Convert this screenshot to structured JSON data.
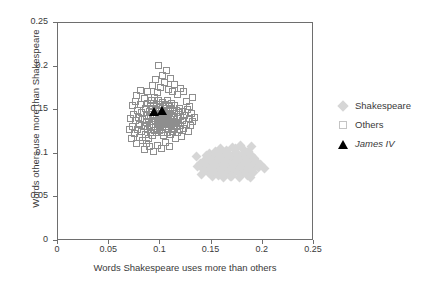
{
  "chart_data": {
    "type": "scatter",
    "title": "",
    "xlabel": "Words Shakespeare uses more than others",
    "ylabel": "Words others use more than Shakespeare",
    "xlim": [
      0,
      0.25
    ],
    "ylim": [
      0,
      0.25
    ],
    "xticks": [
      "0",
      "0.05",
      "0.1",
      "0.15",
      "0.2",
      "0.25"
    ],
    "xtick_values": [
      0,
      0.05,
      0.1,
      0.15,
      0.2,
      0.25
    ],
    "yticks": [
      "0",
      "0.05",
      "0.1",
      "0.15",
      "0.2",
      "0.25"
    ],
    "ytick_values": [
      0,
      0.05,
      0.1,
      0.15,
      0.2,
      0.25
    ],
    "grid": false,
    "legend_position": "right",
    "colors": {
      "shakespeare": "#d6d6d6",
      "others": "#8e8e8e",
      "james_iv": "#000000",
      "axis": "#6e6e6e",
      "text": "#3a3a3a",
      "background": "#ffffff"
    },
    "series": [
      {
        "name": "Shakespeare",
        "marker": "diamond",
        "fill": "#d6d6d6",
        "points": [
          [
            0.135,
            0.097
          ],
          [
            0.139,
            0.089
          ],
          [
            0.142,
            0.082
          ],
          [
            0.144,
            0.094
          ],
          [
            0.146,
            0.086
          ],
          [
            0.147,
            0.078
          ],
          [
            0.148,
            0.1
          ],
          [
            0.149,
            0.091
          ],
          [
            0.15,
            0.084
          ],
          [
            0.151,
            0.074
          ],
          [
            0.152,
            0.095
          ],
          [
            0.153,
            0.088
          ],
          [
            0.154,
            0.081
          ],
          [
            0.155,
            0.102
          ],
          [
            0.156,
            0.093
          ],
          [
            0.157,
            0.086
          ],
          [
            0.158,
            0.079
          ],
          [
            0.159,
            0.097
          ],
          [
            0.16,
            0.09
          ],
          [
            0.16,
            0.083
          ],
          [
            0.161,
            0.076
          ],
          [
            0.162,
            0.099
          ],
          [
            0.163,
            0.092
          ],
          [
            0.163,
            0.085
          ],
          [
            0.164,
            0.078
          ],
          [
            0.165,
            0.104
          ],
          [
            0.165,
            0.095
          ],
          [
            0.166,
            0.088
          ],
          [
            0.167,
            0.081
          ],
          [
            0.168,
            0.074
          ],
          [
            0.168,
            0.098
          ],
          [
            0.169,
            0.091
          ],
          [
            0.17,
            0.084
          ],
          [
            0.17,
            0.107
          ],
          [
            0.171,
            0.077
          ],
          [
            0.172,
            0.094
          ],
          [
            0.172,
            0.087
          ],
          [
            0.173,
            0.08
          ],
          [
            0.174,
            0.101
          ],
          [
            0.174,
            0.092
          ],
          [
            0.175,
            0.085
          ],
          [
            0.176,
            0.078
          ],
          [
            0.176,
            0.097
          ],
          [
            0.177,
            0.09
          ],
          [
            0.178,
            0.083
          ],
          [
            0.178,
            0.11
          ],
          [
            0.179,
            0.076
          ],
          [
            0.18,
            0.094
          ],
          [
            0.18,
            0.087
          ],
          [
            0.181,
            0.1
          ],
          [
            0.182,
            0.081
          ],
          [
            0.182,
            0.092
          ],
          [
            0.183,
            0.085
          ],
          [
            0.184,
            0.097
          ],
          [
            0.184,
            0.078
          ],
          [
            0.185,
            0.089
          ],
          [
            0.186,
            0.103
          ],
          [
            0.186,
            0.082
          ],
          [
            0.187,
            0.094
          ],
          [
            0.188,
            0.087
          ],
          [
            0.188,
            0.073
          ],
          [
            0.189,
            0.098
          ],
          [
            0.19,
            0.09
          ],
          [
            0.191,
            0.083
          ],
          [
            0.192,
            0.095
          ],
          [
            0.193,
            0.087
          ],
          [
            0.194,
            0.091
          ],
          [
            0.196,
            0.084
          ],
          [
            0.198,
            0.088
          ],
          [
            0.202,
            0.083
          ],
          [
            0.14,
            0.076
          ],
          [
            0.143,
            0.089
          ],
          [
            0.145,
            0.098
          ],
          [
            0.151,
            0.08
          ],
          [
            0.154,
            0.103
          ],
          [
            0.157,
            0.075
          ],
          [
            0.159,
            0.106
          ],
          [
            0.162,
            0.073
          ],
          [
            0.166,
            0.1
          ],
          [
            0.169,
            0.074
          ],
          [
            0.173,
            0.106
          ],
          [
            0.177,
            0.073
          ],
          [
            0.181,
            0.105
          ],
          [
            0.185,
            0.075
          ],
          [
            0.189,
            0.108
          ],
          [
            0.191,
            0.078
          ],
          [
            0.136,
            0.086
          ],
          [
            0.148,
            0.093
          ],
          [
            0.152,
            0.089
          ],
          [
            0.158,
            0.096
          ],
          [
            0.164,
            0.09
          ],
          [
            0.171,
            0.089
          ],
          [
            0.175,
            0.093
          ],
          [
            0.179,
            0.086
          ],
          [
            0.183,
            0.09
          ],
          [
            0.187,
            0.085
          ]
        ]
      },
      {
        "name": "Others",
        "marker": "open-square",
        "stroke": "#8e8e8e",
        "points": [
          [
            0.072,
            0.117
          ],
          [
            0.073,
            0.131
          ],
          [
            0.074,
            0.145
          ],
          [
            0.075,
            0.123
          ],
          [
            0.076,
            0.138
          ],
          [
            0.076,
            0.16
          ],
          [
            0.077,
            0.112
          ],
          [
            0.078,
            0.128
          ],
          [
            0.078,
            0.15
          ],
          [
            0.079,
            0.142
          ],
          [
            0.08,
            0.119
          ],
          [
            0.08,
            0.134
          ],
          [
            0.081,
            0.157
          ],
          [
            0.082,
            0.126
          ],
          [
            0.082,
            0.147
          ],
          [
            0.083,
            0.115
          ],
          [
            0.083,
            0.139
          ],
          [
            0.084,
            0.131
          ],
          [
            0.084,
            0.163
          ],
          [
            0.085,
            0.122
          ],
          [
            0.085,
            0.152
          ],
          [
            0.086,
            0.136
          ],
          [
            0.086,
            0.144
          ],
          [
            0.087,
            0.128
          ],
          [
            0.087,
            0.158
          ],
          [
            0.088,
            0.118
          ],
          [
            0.088,
            0.14
          ],
          [
            0.089,
            0.133
          ],
          [
            0.089,
            0.149
          ],
          [
            0.09,
            0.125
          ],
          [
            0.09,
            0.155
          ],
          [
            0.09,
            0.143
          ],
          [
            0.091,
            0.137
          ],
          [
            0.091,
            0.161
          ],
          [
            0.091,
            0.13
          ],
          [
            0.092,
            0.147
          ],
          [
            0.092,
            0.121
          ],
          [
            0.092,
            0.152
          ],
          [
            0.093,
            0.14
          ],
          [
            0.093,
            0.134
          ],
          [
            0.093,
            0.158
          ],
          [
            0.094,
            0.127
          ],
          [
            0.094,
            0.145
          ],
          [
            0.094,
            0.165
          ],
          [
            0.095,
            0.138
          ],
          [
            0.095,
            0.131
          ],
          [
            0.095,
            0.151
          ],
          [
            0.096,
            0.143
          ],
          [
            0.096,
            0.124
          ],
          [
            0.096,
            0.157
          ],
          [
            0.097,
            0.136
          ],
          [
            0.097,
            0.148
          ],
          [
            0.097,
            0.129
          ],
          [
            0.098,
            0.141
          ],
          [
            0.098,
            0.161
          ],
          [
            0.098,
            0.134
          ],
          [
            0.099,
            0.153
          ],
          [
            0.099,
            0.127
          ],
          [
            0.099,
            0.145
          ],
          [
            0.1,
            0.138
          ],
          [
            0.1,
            0.156
          ],
          [
            0.1,
            0.132
          ],
          [
            0.101,
            0.149
          ],
          [
            0.101,
            0.143
          ],
          [
            0.101,
            0.124
          ],
          [
            0.102,
            0.136
          ],
          [
            0.102,
            0.159
          ],
          [
            0.102,
            0.13
          ],
          [
            0.103,
            0.147
          ],
          [
            0.103,
            0.14
          ],
          [
            0.103,
            0.121
          ],
          [
            0.104,
            0.152
          ],
          [
            0.104,
            0.134
          ],
          [
            0.104,
            0.144
          ],
          [
            0.105,
            0.128
          ],
          [
            0.105,
            0.156
          ],
          [
            0.105,
            0.139
          ],
          [
            0.106,
            0.148
          ],
          [
            0.106,
            0.131
          ],
          [
            0.106,
            0.143
          ],
          [
            0.107,
            0.161
          ],
          [
            0.107,
            0.125
          ],
          [
            0.107,
            0.137
          ],
          [
            0.108,
            0.15
          ],
          [
            0.108,
            0.142
          ],
          [
            0.108,
            0.129
          ],
          [
            0.109,
            0.155
          ],
          [
            0.109,
            0.134
          ],
          [
            0.109,
            0.146
          ],
          [
            0.11,
            0.122
          ],
          [
            0.11,
            0.139
          ],
          [
            0.11,
            0.152
          ],
          [
            0.111,
            0.131
          ],
          [
            0.111,
            0.144
          ],
          [
            0.111,
            0.158
          ],
          [
            0.112,
            0.126
          ],
          [
            0.112,
            0.137
          ],
          [
            0.112,
            0.149
          ],
          [
            0.113,
            0.133
          ],
          [
            0.113,
            0.142
          ],
          [
            0.114,
            0.155
          ],
          [
            0.114,
            0.128
          ],
          [
            0.114,
            0.146
          ],
          [
            0.115,
            0.136
          ],
          [
            0.115,
            0.118
          ],
          [
            0.116,
            0.15
          ],
          [
            0.116,
            0.131
          ],
          [
            0.117,
            0.141
          ],
          [
            0.117,
            0.124
          ],
          [
            0.118,
            0.147
          ],
          [
            0.118,
            0.135
          ],
          [
            0.119,
            0.152
          ],
          [
            0.119,
            0.128
          ],
          [
            0.12,
            0.143
          ],
          [
            0.12,
            0.133
          ],
          [
            0.121,
            0.12
          ],
          [
            0.122,
            0.148
          ],
          [
            0.122,
            0.138
          ],
          [
            0.123,
            0.129
          ],
          [
            0.124,
            0.144
          ],
          [
            0.125,
            0.134
          ],
          [
            0.126,
            0.151
          ],
          [
            0.127,
            0.126
          ],
          [
            0.128,
            0.14
          ],
          [
            0.129,
            0.132
          ],
          [
            0.13,
            0.146
          ],
          [
            0.131,
            0.137
          ],
          [
            0.133,
            0.142
          ],
          [
            0.087,
            0.172
          ],
          [
            0.092,
            0.178
          ],
          [
            0.095,
            0.185
          ],
          [
            0.097,
            0.17
          ],
          [
            0.098,
            0.201
          ],
          [
            0.1,
            0.176
          ],
          [
            0.102,
            0.19
          ],
          [
            0.104,
            0.182
          ],
          [
            0.106,
            0.195
          ],
          [
            0.108,
            0.174
          ],
          [
            0.11,
            0.186
          ],
          [
            0.112,
            0.171
          ],
          [
            0.114,
            0.179
          ],
          [
            0.117,
            0.168
          ],
          [
            0.12,
            0.175
          ],
          [
            0.084,
            0.105
          ],
          [
            0.086,
            0.112
          ],
          [
            0.089,
            0.108
          ],
          [
            0.093,
            0.103
          ],
          [
            0.097,
            0.11
          ],
          [
            0.101,
            0.106
          ],
          [
            0.105,
            0.113
          ],
          [
            0.109,
            0.108
          ],
          [
            0.071,
            0.14
          ],
          [
            0.07,
            0.128
          ],
          [
            0.073,
            0.155
          ],
          [
            0.077,
            0.167
          ],
          [
            0.081,
            0.173
          ],
          [
            0.125,
            0.16
          ],
          [
            0.128,
            0.154
          ],
          [
            0.131,
            0.164
          ],
          [
            0.123,
            0.171
          ]
        ]
      },
      {
        "name": "James IV",
        "marker": "triangle",
        "fill": "#000000",
        "italic": true,
        "points": [
          [
            0.0935,
            0.1475
          ],
          [
            0.1015,
            0.1495
          ]
        ]
      }
    ]
  },
  "legend": {
    "entries": [
      {
        "label": "Shakespeare",
        "marker": "diamond-icon",
        "italic": false
      },
      {
        "label": "Others",
        "marker": "open-square-icon",
        "italic": false
      },
      {
        "label": "James IV",
        "marker": "triangle-icon",
        "italic": true
      }
    ]
  }
}
